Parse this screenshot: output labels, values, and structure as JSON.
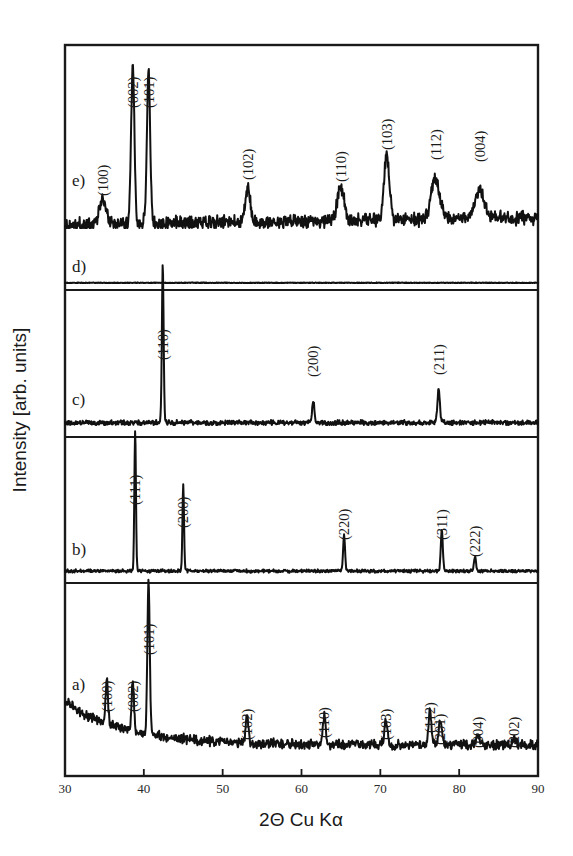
{
  "figure": {
    "title": "",
    "background_color": "#ffffff",
    "line_color": "#111111"
  },
  "axes": {
    "x": {
      "label": "2Θ Cu Kα",
      "min": 30,
      "max": 90,
      "ticks": [
        30,
        40,
        50,
        60,
        70,
        80,
        90
      ],
      "tick_labels": [
        "30",
        "40",
        "50",
        "60",
        "70",
        "80",
        "90"
      ]
    },
    "y": {
      "label": "Intensity [arb. units]",
      "ticks": [],
      "tick_labels": []
    }
  },
  "chart_data": {
    "type": "line",
    "title": "",
    "xlabel": "2Θ Cu Kα",
    "ylabel": "Intensity [arb. units]",
    "xlim": [
      30,
      90
    ],
    "grid": false,
    "legend": "none",
    "stacked_offset_panels": true,
    "series": [
      {
        "name": "e",
        "label": "e)",
        "noise_level": 0.055,
        "baseline_shape": "flat-rising",
        "peaks": [
          {
            "hkl": "(100)",
            "two_theta": 34.8,
            "height": 0.16,
            "width": 0.85
          },
          {
            "hkl": "(002)",
            "two_theta": 38.6,
            "height": 1.0,
            "width": 0.42
          },
          {
            "hkl": "(101)",
            "two_theta": 40.6,
            "height": 0.97,
            "width": 0.42
          },
          {
            "hkl": "(102)",
            "two_theta": 53.2,
            "height": 0.22,
            "width": 0.6
          },
          {
            "hkl": "(110)",
            "two_theta": 65.0,
            "height": 0.21,
            "width": 0.9
          },
          {
            "hkl": "(103)",
            "two_theta": 70.8,
            "height": 0.4,
            "width": 0.7
          },
          {
            "hkl": "(112)",
            "two_theta": 77.0,
            "height": 0.26,
            "width": 1.1
          },
          {
            "hkl": "(004)",
            "two_theta": 82.6,
            "height": 0.2,
            "width": 1.0
          }
        ]
      },
      {
        "name": "d",
        "label": "d)",
        "noise_level": 0.045,
        "baseline_shape": "flat",
        "peaks": []
      },
      {
        "name": "c",
        "label": "c)",
        "noise_level": 0.02,
        "baseline_shape": "flat",
        "peaks": [
          {
            "hkl": "(110)",
            "two_theta": 42.4,
            "height": 1.0,
            "width": 0.22
          },
          {
            "hkl": "(200)",
            "two_theta": 61.5,
            "height": 0.13,
            "width": 0.3
          },
          {
            "hkl": "(211)",
            "two_theta": 77.4,
            "height": 0.22,
            "width": 0.3
          }
        ]
      },
      {
        "name": "b",
        "label": "b)",
        "noise_level": 0.014,
        "baseline_shape": "flat",
        "peaks": [
          {
            "hkl": "(111)",
            "two_theta": 38.9,
            "height": 1.0,
            "width": 0.2
          },
          {
            "hkl": "(200)",
            "two_theta": 45.0,
            "height": 0.61,
            "width": 0.2
          },
          {
            "hkl": "(220)",
            "two_theta": 65.4,
            "height": 0.26,
            "width": 0.24
          },
          {
            "hkl": "(311)",
            "two_theta": 77.8,
            "height": 0.29,
            "width": 0.26
          },
          {
            "hkl": "(222)",
            "two_theta": 82.0,
            "height": 0.1,
            "width": 0.26
          }
        ]
      },
      {
        "name": "a",
        "label": "a)",
        "noise_level": 0.04,
        "baseline_shape": "decaying",
        "peaks": [
          {
            "hkl": "(100)",
            "two_theta": 35.3,
            "height": 0.3,
            "width": 0.3
          },
          {
            "hkl": "(002)",
            "two_theta": 38.6,
            "height": 0.33,
            "width": 0.3
          },
          {
            "hkl": "(101)",
            "two_theta": 40.6,
            "height": 1.0,
            "width": 0.3
          },
          {
            "hkl": "(102)",
            "two_theta": 53.1,
            "height": 0.18,
            "width": 0.35
          },
          {
            "hkl": "(110)",
            "two_theta": 62.9,
            "height": 0.2,
            "width": 0.35
          },
          {
            "hkl": "(103)",
            "two_theta": 70.7,
            "height": 0.16,
            "width": 0.4
          },
          {
            "hkl": "(112)",
            "two_theta": 76.3,
            "height": 0.22,
            "width": 0.38
          },
          {
            "hkl": "(201)",
            "two_theta": 77.6,
            "height": 0.16,
            "width": 0.38
          },
          {
            "hkl": "(004)",
            "two_theta": 82.4,
            "height": 0.06,
            "width": 0.45
          },
          {
            "hkl": "(202)",
            "two_theta": 87.0,
            "height": 0.05,
            "width": 0.45
          }
        ]
      }
    ]
  },
  "curve_labels": [
    {
      "id": "e",
      "text": "e)"
    },
    {
      "id": "d",
      "text": "d)"
    },
    {
      "id": "c",
      "text": "c)"
    },
    {
      "id": "b",
      "text": "b)"
    },
    {
      "id": "a",
      "text": "a)"
    }
  ]
}
